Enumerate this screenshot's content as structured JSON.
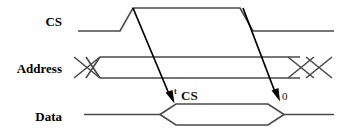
{
  "diagram": {
    "background_color": "#ffffff",
    "wave_color": "#4a4a4a",
    "arrow_color": "#000000",
    "text_color": "#000000",
    "width": 339,
    "height": 136
  },
  "signals": [
    {
      "name": "cs",
      "label": "CS",
      "label_x": 62,
      "label_y": 26,
      "type": "single-line",
      "low_level_y": 31,
      "high_level_y": 8,
      "rise_start_x": 120,
      "rise_end_x": 133,
      "fall_start_x": 240,
      "fall_end_x": 253,
      "start_x": 78,
      "end_x": 334
    },
    {
      "name": "address",
      "label": "Address",
      "label_x": 8,
      "label_y": 73,
      "type": "bus",
      "top_y": 57,
      "bottom_y": 78,
      "mid_y": 67.5,
      "start_x": 74,
      "end_x": 332,
      "left_cross_start_x": 74,
      "left_cross_end_x": 100,
      "right_cross_start_x": 288,
      "right_cross_end_x": 332
    },
    {
      "name": "data",
      "label": "Data",
      "label_x": 38,
      "label_y": 121,
      "type": "bus-valid-window",
      "top_y": 104,
      "bottom_y": 125,
      "mid_y": 114.5,
      "start_x": 84,
      "end_x": 334,
      "open_start_x": 160,
      "open_end_x": 176,
      "close_start_x": 268,
      "close_end_x": 284
    }
  ],
  "arrows": [
    {
      "name": "t-cs-arrow",
      "from_x": 133,
      "from_y": 8,
      "to_x": 170,
      "to_y": 101,
      "label_sub": "t",
      "label_main": "CS",
      "label_sub_x": 172,
      "label_sub_y": 95,
      "label_main_x": 179,
      "label_main_y": 100
    },
    {
      "name": "output-disable-arrow",
      "from_x": 243,
      "from_y": 8,
      "to_x": 276,
      "to_y": 99,
      "label_sub": "",
      "label_main": "0",
      "label_sub_x": 0,
      "label_sub_y": 0,
      "label_main_x": 281,
      "label_main_y": 99
    }
  ],
  "annotations": {
    "t_cs": "t CS",
    "zero": "0"
  }
}
